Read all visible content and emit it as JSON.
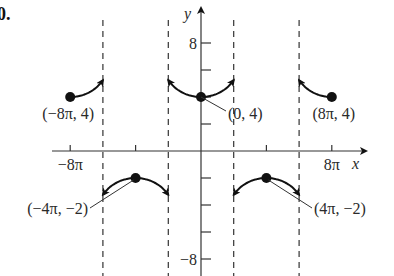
{
  "problem_number": "0.",
  "chart_data": {
    "type": "line",
    "title": "",
    "function_description": "secant-type graph with period 16π, local minima at (−8π,4),(0,4),(8π,4) and local maxima at (−4π,−2),(4π,−2)",
    "xlabel": "x",
    "ylabel": "y",
    "xlim_pi_units": [
      -8.5,
      9.5
    ],
    "ylim": [
      -8.5,
      9
    ],
    "x_tick_labels": [
      {
        "value_pi": -8,
        "label": "−8π"
      },
      {
        "value_pi": 8,
        "label": "8π"
      }
    ],
    "x_ticks_pi": [
      -8,
      -4,
      0,
      4,
      8
    ],
    "y_tick_labels": [
      {
        "value": 8,
        "label": "8"
      },
      {
        "value": -8,
        "label": "−8"
      }
    ],
    "y_ticks": [
      8,
      6,
      4,
      2,
      -2,
      -4,
      -6,
      -8
    ],
    "asymptotes_pi": [
      -6,
      -2,
      2,
      6
    ],
    "key_points": [
      {
        "x_pi": -8,
        "y": 4,
        "label": "(−8π, 4)"
      },
      {
        "x_pi": 0,
        "y": 4,
        "label": "(0, 4)"
      },
      {
        "x_pi": 8,
        "y": 4,
        "label": "(8π, 4)"
      },
      {
        "x_pi": -4,
        "y": -2,
        "label": "(−4π, −2)"
      },
      {
        "x_pi": 4,
        "y": -2,
        "label": "(4π, −2)"
      }
    ],
    "branches": [
      {
        "name": "branch-left-up",
        "center_pi": -8,
        "direction": "up",
        "from_pi": -8,
        "to_pi": -6
      },
      {
        "name": "branch-center-up",
        "center_pi": 0,
        "direction": "up",
        "from_pi": -2,
        "to_pi": 2
      },
      {
        "name": "branch-right-up",
        "center_pi": 8,
        "direction": "up",
        "from_pi": 6,
        "to_pi": 8
      },
      {
        "name": "branch-left-down",
        "center_pi": -4,
        "direction": "down",
        "from_pi": -6,
        "to_pi": -2
      },
      {
        "name": "branch-right-down",
        "center_pi": 4,
        "direction": "down",
        "from_pi": 2,
        "to_pi": 6
      }
    ],
    "grid": false,
    "legend": "none"
  }
}
